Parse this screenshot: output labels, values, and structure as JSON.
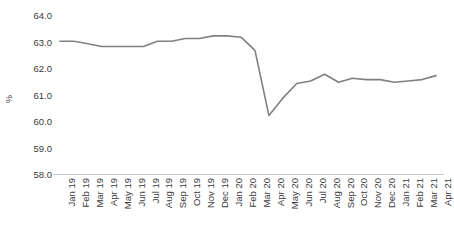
{
  "chart_data": {
    "type": "line",
    "title": "",
    "xlabel": "",
    "ylabel": "%",
    "ylim": [
      58.0,
      64.0
    ],
    "ytick_step": 1.0,
    "ytick_labels": [
      "64.0",
      "63.0",
      "62.0",
      "61.0",
      "60.0",
      "59.0",
      "58.0"
    ],
    "ytick_values": [
      64.0,
      63.0,
      62.0,
      61.0,
      60.0,
      59.0,
      58.0
    ],
    "grid": false,
    "legend": "none",
    "line_color": "#808080",
    "categories": [
      "Jan 19",
      "Feb 19",
      "Mar 19",
      "Apr 19",
      "May 19",
      "Jun 19",
      "Jul 19",
      "Aug 19",
      "Sep 19",
      "Oct 19",
      "Nov 19",
      "Dec 19",
      "Jan 20",
      "Feb 20",
      "Mar 20",
      "Apr 20",
      "May 20",
      "Jun 20",
      "Jul 20",
      "Aug 20",
      "Sep 20",
      "Oct 20",
      "Nov 20",
      "Dec 20",
      "Jan 21",
      "Feb 21",
      "Mar 21",
      "Apr 21"
    ],
    "series": [
      {
        "name": "Labour force participation rate",
        "values": [
          63.05,
          63.05,
          62.95,
          62.85,
          62.85,
          62.85,
          62.85,
          63.05,
          63.05,
          63.15,
          63.15,
          63.25,
          63.25,
          63.2,
          62.7,
          60.25,
          60.9,
          61.45,
          61.55,
          61.8,
          61.5,
          61.65,
          61.6,
          61.6,
          61.5,
          61.55,
          61.6,
          61.75
        ]
      }
    ]
  }
}
